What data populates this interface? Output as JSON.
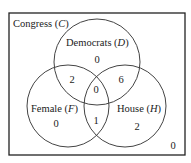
{
  "diagram": {
    "universe_label": "Congress",
    "universe_symbol": "C",
    "sets": [
      {
        "name": "Democrats",
        "symbol": "D"
      },
      {
        "name": "Female",
        "symbol": "F"
      },
      {
        "name": "House",
        "symbol": "H"
      }
    ],
    "regions": {
      "D_only": "0",
      "F_only": "0",
      "H_only": "2",
      "D_and_F_only": "2",
      "D_and_H_only": "6",
      "F_and_H_only": "1",
      "D_F_H": "0",
      "outside": "0"
    },
    "colors": {
      "stroke": "#333333",
      "background": "#ffffff"
    }
  }
}
